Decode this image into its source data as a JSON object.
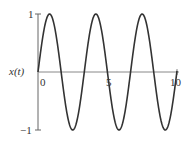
{
  "chart_data": {
    "type": "line",
    "title": "",
    "xlabel": "",
    "ylabel": "x(t)",
    "xlim": [
      0,
      10
    ],
    "ylim": [
      -1,
      1
    ],
    "x_ticks": [
      "0",
      "5",
      "10"
    ],
    "y_ticks": [
      "1",
      "-1"
    ],
    "y_tick_labels": {
      "top": "1",
      "bottom": "−1"
    },
    "grid": false,
    "legend": null,
    "series": [
      {
        "name": "x(t)",
        "function": "sin(2*pi*t/3.33)",
        "period": 3.33,
        "amplitude": 1,
        "x": [
          0,
          0.83,
          1.67,
          2.5,
          3.33,
          4.17,
          5.0,
          5.83,
          6.67,
          7.5,
          8.33,
          9.17,
          10
        ],
        "values": [
          0,
          1,
          0,
          -1,
          0,
          1,
          0,
          -1,
          0,
          1,
          0,
          -1,
          0
        ]
      }
    ],
    "color": "#333333"
  }
}
